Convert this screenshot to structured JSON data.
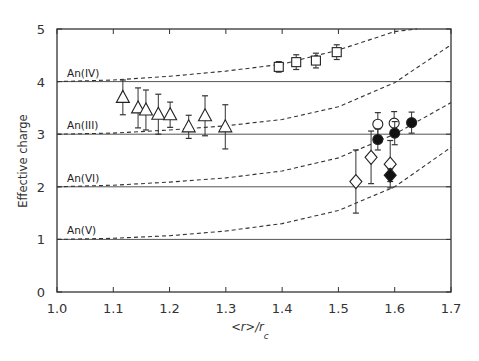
{
  "chart_data": {
    "type": "scatter",
    "title": "",
    "xlabel": "<r>/r",
    "xlabel_subscript": "c",
    "ylabel": "Effective charge",
    "xlim": [
      1.0,
      1.7
    ],
    "ylim": [
      0,
      5
    ],
    "xticks": [
      "1.0",
      "1.1",
      "1.2",
      "1.3",
      "1.4",
      "1.5",
      "1.6",
      "1.7"
    ],
    "yticks": [
      "0",
      "1",
      "2",
      "3",
      "4",
      "5"
    ],
    "grid": false,
    "legend": null,
    "reference_lines": [
      1,
      2,
      3,
      4
    ],
    "curves": [
      {
        "label": "An(IV)",
        "base": 4,
        "points": [
          [
            1.0,
            4.0
          ],
          [
            1.1,
            4.03
          ],
          [
            1.2,
            4.1
          ],
          [
            1.3,
            4.2
          ],
          [
            1.4,
            4.33
          ],
          [
            1.5,
            4.6
          ],
          [
            1.6,
            4.95
          ],
          [
            1.64,
            5.0
          ]
        ]
      },
      {
        "label": "An(III)",
        "base": 3,
        "points": [
          [
            1.0,
            3.0
          ],
          [
            1.1,
            3.02
          ],
          [
            1.2,
            3.08
          ],
          [
            1.3,
            3.16
          ],
          [
            1.4,
            3.28
          ],
          [
            1.5,
            3.52
          ],
          [
            1.6,
            3.98
          ],
          [
            1.7,
            4.7
          ]
        ]
      },
      {
        "label": "An(VI)",
        "base": 2,
        "points": [
          [
            1.0,
            2.0
          ],
          [
            1.1,
            2.03
          ],
          [
            1.2,
            2.09
          ],
          [
            1.3,
            2.17
          ],
          [
            1.4,
            2.3
          ],
          [
            1.5,
            2.55
          ],
          [
            1.6,
            3.0
          ],
          [
            1.7,
            3.6
          ]
        ]
      },
      {
        "label": "An(V)",
        "base": 1,
        "points": [
          [
            1.0,
            1.0
          ],
          [
            1.1,
            1.02
          ],
          [
            1.2,
            1.07
          ],
          [
            1.3,
            1.16
          ],
          [
            1.4,
            1.3
          ],
          [
            1.5,
            1.55
          ],
          [
            1.6,
            2.0
          ],
          [
            1.7,
            2.75
          ]
        ]
      }
    ],
    "series": [
      {
        "name": "open-triangle",
        "marker": "triangle",
        "filled": false,
        "x": [
          1.117,
          1.144,
          1.158,
          1.18,
          1.201,
          1.234,
          1.263,
          1.299
        ],
        "y": [
          3.7,
          3.5,
          3.46,
          3.38,
          3.37,
          3.14,
          3.35,
          3.14
        ],
        "err": [
          0.33,
          0.38,
          0.38,
          0.38,
          0.24,
          0.22,
          0.38,
          0.42
        ]
      },
      {
        "name": "open-square",
        "marker": "square",
        "filled": false,
        "x": [
          1.394,
          1.425,
          1.46,
          1.497
        ],
        "y": [
          4.28,
          4.37,
          4.4,
          4.56
        ],
        "err": [
          0.1,
          0.14,
          0.14,
          0.14
        ]
      },
      {
        "name": "open-circle",
        "marker": "circle",
        "filled": false,
        "x": [
          1.57,
          1.599
        ],
        "y": [
          3.19,
          3.21
        ],
        "err": [
          0.22,
          0.22
        ]
      },
      {
        "name": "filled-circle",
        "marker": "circle",
        "filled": true,
        "x": [
          1.57,
          1.6,
          1.63
        ],
        "y": [
          2.9,
          3.02,
          3.22
        ],
        "err": [
          0.2,
          0.22,
          0.2
        ]
      },
      {
        "name": "open-diamond",
        "marker": "diamond",
        "filled": false,
        "x": [
          1.531,
          1.558,
          1.592
        ],
        "y": [
          2.1,
          2.56,
          2.43
        ],
        "err": [
          0.6,
          0.5,
          0.45
        ]
      },
      {
        "name": "filled-diamond",
        "marker": "diamond",
        "filled": true,
        "x": [
          1.592
        ],
        "y": [
          2.22
        ],
        "err": [
          0.12
        ]
      }
    ]
  }
}
